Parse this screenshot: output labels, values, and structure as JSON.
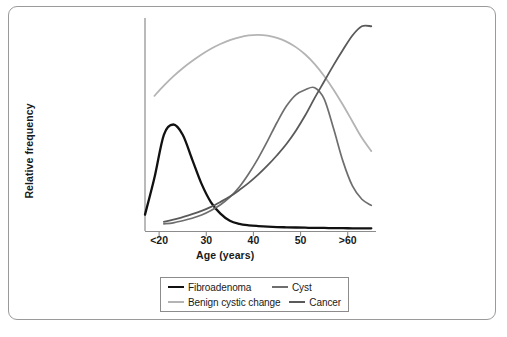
{
  "figure": {
    "border_color": "#9a9a9a"
  },
  "chart_data": {
    "type": "line",
    "title": "",
    "xlabel": "Age (years)",
    "ylabel": "Relative frequency",
    "xtick_labels": [
      "<20",
      "30",
      "40",
      "50",
      ">60"
    ],
    "xtick_values": [
      20,
      30,
      40,
      50,
      60
    ],
    "xlim": [
      17,
      66
    ],
    "ylim": [
      0,
      1.05
    ],
    "grid": false,
    "y_axis_ticks_shown": false,
    "legend_position": "below-axes",
    "legend_layout": "2x2",
    "x": [
      17,
      19,
      21,
      23,
      25,
      27,
      29,
      31,
      33,
      35,
      37,
      39,
      41,
      43,
      45,
      47,
      49,
      51,
      53,
      55,
      57,
      59,
      61,
      63,
      65
    ],
    "series": [
      {
        "name": "Fibroadenoma",
        "color": "#111111",
        "width": 2.3,
        "values": [
          0.08,
          0.26,
          0.47,
          0.52,
          0.47,
          0.35,
          0.23,
          0.14,
          0.085,
          0.05,
          0.035,
          0.028,
          0.024,
          0.021,
          0.019,
          0.018,
          0.017,
          0.016,
          0.015,
          0.015,
          0.014,
          0.014,
          0.013,
          0.013,
          0.013
        ]
      },
      {
        "name": "Cyst",
        "color": "#6e6e6e",
        "width": 1.7,
        "values": [
          null,
          null,
          0.035,
          0.04,
          0.05,
          0.062,
          0.078,
          0.1,
          0.128,
          0.165,
          0.215,
          0.28,
          0.355,
          0.44,
          0.53,
          0.61,
          0.665,
          0.69,
          0.7,
          0.645,
          0.5,
          0.34,
          0.22,
          0.155,
          0.125
        ]
      },
      {
        "name": "Benign cystic change",
        "color": "#b4b4b4",
        "width": 1.8,
        "values": [
          null,
          0.66,
          0.71,
          0.755,
          0.795,
          0.83,
          0.862,
          0.89,
          0.913,
          0.932,
          0.946,
          0.955,
          0.958,
          0.954,
          0.943,
          0.925,
          0.898,
          0.862,
          0.815,
          0.757,
          0.69,
          0.615,
          0.535,
          0.455,
          0.39
        ]
      },
      {
        "name": "Cancer",
        "color": "#5a5a5a",
        "width": 1.8,
        "values": [
          null,
          null,
          0.045,
          0.055,
          0.068,
          0.082,
          0.098,
          0.118,
          0.142,
          0.168,
          0.2,
          0.235,
          0.275,
          0.32,
          0.37,
          0.425,
          0.49,
          0.565,
          0.65,
          0.73,
          0.81,
          0.885,
          0.955,
          1.0,
          1.0
        ]
      }
    ],
    "annotations": []
  },
  "legend": {
    "rows": [
      [
        {
          "label": "Fibroadenoma",
          "swatch": "sw-fibro"
        },
        {
          "label": "Cyst",
          "swatch": "sw-cyst"
        }
      ],
      [
        {
          "label": "Benign cystic change",
          "swatch": "sw-benign"
        },
        {
          "label": "Cancer",
          "swatch": "sw-cancer"
        }
      ]
    ]
  }
}
